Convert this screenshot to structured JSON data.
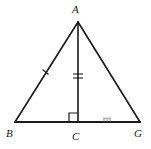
{
  "figure": {
    "background_color": "#ffffff",
    "stroke_color": "#1a1a1a",
    "labels": {
      "apex": "A",
      "base_left": "B",
      "foot": "C",
      "base_right": "G"
    },
    "points": {
      "A": {
        "x": 78,
        "y": 22
      },
      "B": {
        "x": 15,
        "y": 122
      },
      "C": {
        "x": 78,
        "y": 122
      },
      "G": {
        "x": 140,
        "y": 122
      }
    },
    "segments": [
      {
        "name": "AB",
        "from": "A",
        "to": "B",
        "tick_marks": 1
      },
      {
        "name": "AG",
        "from": "A",
        "to": "G",
        "tick_marks": 0
      },
      {
        "name": "BG",
        "from": "B",
        "to": "G",
        "tick_marks": 0
      },
      {
        "name": "AC",
        "from": "A",
        "to": "C",
        "tick_marks": 2
      }
    ],
    "markings": {
      "right_angle_at": "C",
      "right_angle_size": 9,
      "hatch_on_segment": "CG",
      "hatch_count": 3
    }
  }
}
